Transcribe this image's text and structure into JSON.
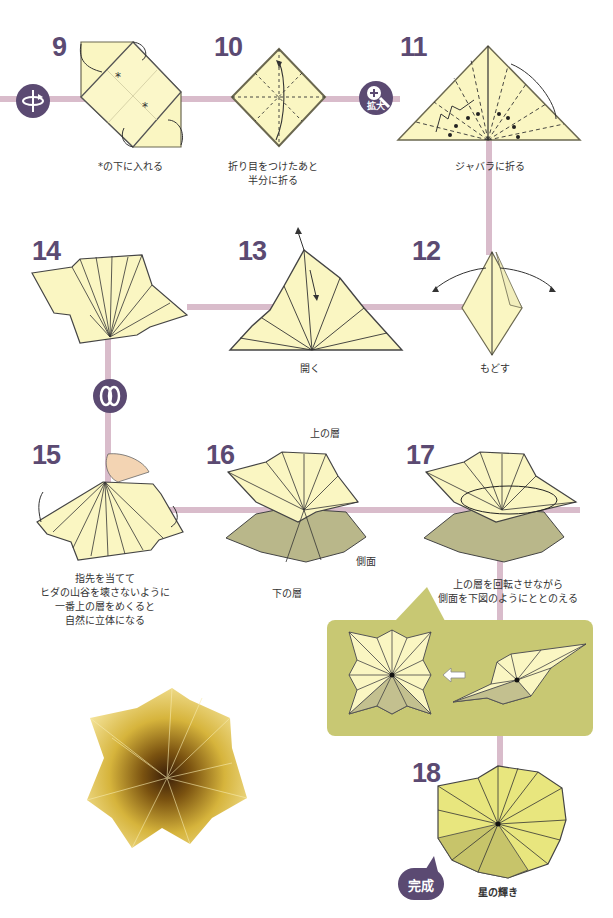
{
  "theme": {
    "path_color": "#d9bccb",
    "badge_color": "#5b4a72",
    "paper_color": "#faf6c2",
    "paper_shadow": "#b9b78a",
    "panel_color": "#c8c873",
    "gold_color": "#c9a227"
  },
  "steps": [
    {
      "number": "9",
      "caption": "*の下に入れる",
      "marks": [
        "*",
        "*"
      ]
    },
    {
      "number": "10",
      "caption_line1": "折り目をつけたあと",
      "caption_line2": "半分に折る"
    },
    {
      "number": "11",
      "caption": "ジャバラに折る"
    },
    {
      "number": "12",
      "caption": "もどす"
    },
    {
      "number": "13",
      "caption": "開く"
    },
    {
      "number": "14"
    },
    {
      "number": "15",
      "caption_lines": [
        "指先を当てて",
        "ヒダの山谷を壊さないように",
        "一番上の層をめくると",
        "自然に立体になる"
      ]
    },
    {
      "number": "16",
      "labels": {
        "top_layer": "上の層",
        "bottom_layer": "下の層",
        "side": "側面"
      }
    },
    {
      "number": "17",
      "caption_line1": "上の層を回転させながら",
      "caption_line2": "側面を下図のようにととのえる"
    },
    {
      "number": "18",
      "caption": "星の輝き"
    }
  ],
  "badges": {
    "flip": {
      "icon": "flip-over-icon"
    },
    "zoom": {
      "icon": "magnify-plus-icon",
      "label": "拡大"
    },
    "turn": {
      "icon": "rotate-icon"
    },
    "done": {
      "label": "完成"
    }
  },
  "detail_panel": {
    "arrow": "left-arrow-icon"
  },
  "photo": {
    "subject": "gold-origami-star"
  }
}
